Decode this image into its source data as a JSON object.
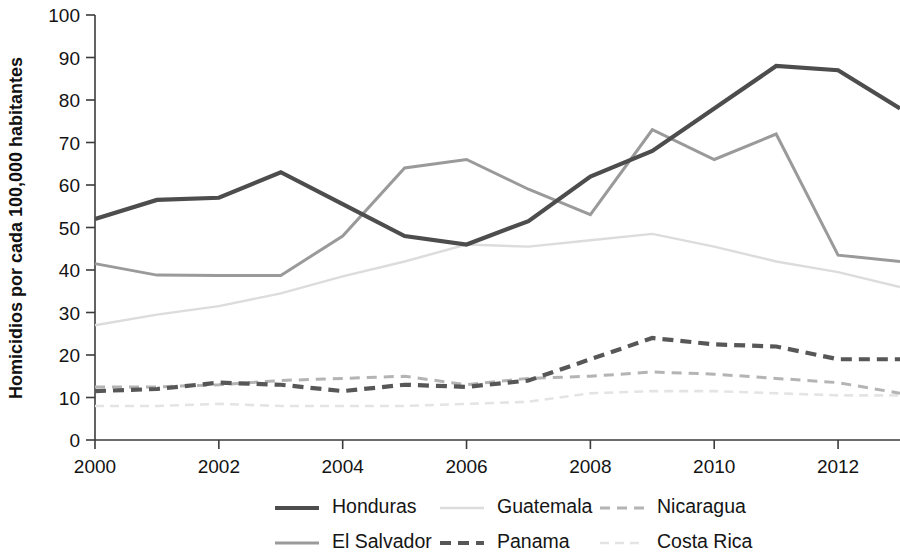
{
  "chart_data": {
    "type": "line",
    "title": "",
    "xlabel": "",
    "ylabel": "Homicidios por cada 100,000 habitantes",
    "xlim": [
      2000,
      2013
    ],
    "ylim": [
      0,
      100
    ],
    "grid": false,
    "legend_position": "bottom",
    "x": [
      2000,
      2001,
      2002,
      2003,
      2004,
      2005,
      2006,
      2007,
      2008,
      2009,
      2010,
      2011,
      2012,
      2013
    ],
    "xticks": [
      2000,
      2002,
      2004,
      2006,
      2008,
      2010,
      2012
    ],
    "xtick_labels": [
      "2000",
      "2002",
      "2004",
      "2006",
      "2008",
      "2010",
      "2012"
    ],
    "yticks": [
      0,
      10,
      20,
      30,
      40,
      50,
      60,
      70,
      80,
      90,
      100
    ],
    "ytick_labels": [
      "0",
      "10",
      "20",
      "30",
      "40",
      "50",
      "60",
      "70",
      "80",
      "90",
      "100"
    ],
    "series": [
      {
        "name": "Honduras",
        "color": "#4d4d4d",
        "width": 4.2,
        "dash": "none",
        "values": [
          52,
          56.5,
          57,
          63,
          55.5,
          48,
          46,
          51.5,
          62,
          68,
          78,
          88,
          87,
          78
        ]
      },
      {
        "name": "El Salvador",
        "color": "#9a9a9a",
        "width": 3.0,
        "dash": "none",
        "values": [
          41.5,
          38.8,
          38.7,
          38.7,
          48,
          64,
          66,
          59,
          53,
          73,
          66,
          72,
          43.5,
          42
        ]
      },
      {
        "name": "Guatemala",
        "color": "#dcdcdc",
        "width": 2.4,
        "dash": "none",
        "values": [
          27,
          29.5,
          31.5,
          34.5,
          38.5,
          42,
          46,
          45.5,
          47,
          48.5,
          45.5,
          42,
          39.5,
          36
        ]
      },
      {
        "name": "Nicaragua",
        "color": "#b4b4b4",
        "width": 3.0,
        "dash": "10,7",
        "values": [
          12.5,
          12.5,
          13,
          14,
          14.5,
          15,
          13,
          14.5,
          15,
          16,
          15.5,
          14.5,
          13.5,
          11
        ]
      },
      {
        "name": "Panama",
        "color": "#575757",
        "width": 4.2,
        "dash": "11,7",
        "values": [
          11.5,
          12,
          13.5,
          13,
          11.5,
          13,
          12.5,
          14,
          19,
          24,
          22.5,
          22,
          19,
          19
        ]
      },
      {
        "name": "Costa Rica",
        "color": "#e4e4e4",
        "width": 2.6,
        "dash": "9,6",
        "values": [
          8,
          8,
          8.5,
          8,
          8,
          8,
          8.5,
          9,
          11,
          11.5,
          11.5,
          11,
          10.5,
          10.5
        ]
      }
    ],
    "legend": [
      {
        "label": "Honduras",
        "row": 0,
        "col": 0
      },
      {
        "label": "Guatemala",
        "row": 0,
        "col": 1
      },
      {
        "label": "Nicaragua",
        "row": 0,
        "col": 2
      },
      {
        "label": "El Salvador",
        "row": 1,
        "col": 0
      },
      {
        "label": "Panama",
        "row": 1,
        "col": 1
      },
      {
        "label": "Costa Rica",
        "row": 1,
        "col": 2
      }
    ]
  }
}
